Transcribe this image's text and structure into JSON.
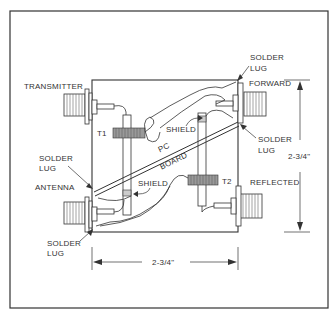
{
  "diagram": {
    "title": "",
    "connectors": [
      {
        "id": "transmitter",
        "label": "TRANSMITTER",
        "position": "top-left"
      },
      {
        "id": "forward",
        "label": "FORWARD",
        "position": "top-right"
      },
      {
        "id": "antenna",
        "label": "ANTENNA",
        "position": "bottom-left"
      },
      {
        "id": "reflected",
        "label": "REFLECTED",
        "position": "bottom-right"
      }
    ],
    "transformers": [
      {
        "id": "t1",
        "label": "T1"
      },
      {
        "id": "t2",
        "label": "T2"
      }
    ],
    "shield_labels": [
      "SHIELD",
      "SHIELD"
    ],
    "pc_board": {
      "line1": "PC",
      "line2": "BOARD"
    },
    "solder_lugs": [
      {
        "line1": "SOLDER",
        "line2": "LUG",
        "position": "top-right-upper"
      },
      {
        "line1": "SOLDER",
        "line2": "LUG",
        "position": "top-right-lower"
      },
      {
        "line1": "SOLDER",
        "line2": "LUG",
        "position": "left-middle"
      },
      {
        "line1": "SOLDER",
        "line2": "LUG",
        "position": "bottom-left"
      }
    ],
    "dimensions": {
      "height": "2-3/4\"",
      "width": "2-3/4\""
    },
    "colors": {
      "line": "#333333",
      "background": "#ffffff"
    }
  }
}
